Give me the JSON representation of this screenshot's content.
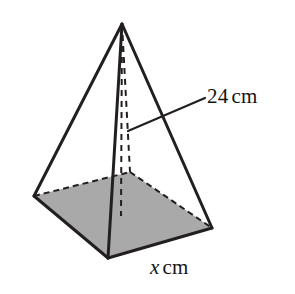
{
  "figure": {
    "kind": "square-based-pyramid",
    "projection": "oblique",
    "background_color": "#ffffff",
    "stroke_color": "#231f20",
    "base_fill_color": "#a9a9a9",
    "hidden_edge_style": "dashed"
  },
  "labels": {
    "slant": {
      "value": "24",
      "unit": "cm",
      "full_text": "24 cm",
      "describes": "slant-height-edge"
    },
    "base": {
      "value": "x",
      "unit": "cm",
      "full_text": "x cm",
      "describes": "base-edge-length",
      "italic_value": true
    }
  },
  "leader_line": {
    "from_x": 128,
    "from_y": 131,
    "to_x": 205,
    "to_y": 98
  },
  "geometry": {
    "apex": {
      "x": 122,
      "y": 24
    },
    "base_corners": {
      "left": {
        "x": 34,
        "y": 196
      },
      "front": {
        "x": 108,
        "y": 258
      },
      "right": {
        "x": 212,
        "y": 228
      },
      "back": {
        "x": 130,
        "y": 172
      }
    },
    "base_center": {
      "x": 121,
      "y": 214
    },
    "visible_edges": [
      "apex-left",
      "apex-front",
      "apex-right",
      "left-front",
      "front-right"
    ],
    "hidden_edges": [
      "apex-back",
      "left-back",
      "back-right",
      "apex-base-center"
    ]
  }
}
